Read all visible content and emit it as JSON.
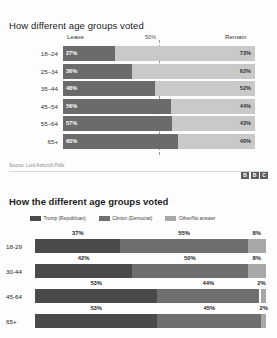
{
  "chart_data": [
    {
      "type": "bar",
      "subtype": "stacked-horizontal-100",
      "title": "How different age groups voted",
      "categories": [
        "18–24",
        "25–34",
        "35–44",
        "45–54",
        "55–64",
        "65+"
      ],
      "series": [
        {
          "name": "Leave",
          "values": [
            27,
            36,
            48,
            56,
            57,
            60
          ],
          "color": "#6b6b6b"
        },
        {
          "name": "Remain",
          "values": [
            73,
            62,
            52,
            44,
            43,
            40
          ],
          "color": "#c9c9c9"
        }
      ],
      "value_labels_left": [
        "27%",
        "36%",
        "48%",
        "56%",
        "57%",
        "60%"
      ],
      "value_labels_right": [
        "73%",
        "62%",
        "52%",
        "44%",
        "43%",
        "40%"
      ],
      "header_left": "Leave",
      "header_right": "Remain",
      "midline_label": "50%",
      "grid": false,
      "legend_position": "top",
      "source": "Source: Lord Ashcroft Polls",
      "brand": [
        "B",
        "B",
        "C"
      ]
    },
    {
      "type": "bar",
      "subtype": "stacked-horizontal-100",
      "title": "How the different age groups voted",
      "categories": [
        "18-29",
        "30-44",
        "45-64",
        "65+"
      ],
      "series": [
        {
          "name": "Trump (Republican)",
          "values": [
            37,
            42,
            53,
            53
          ],
          "color": "#4a4a4a"
        },
        {
          "name": "Clinton (Democrat)",
          "values": [
            55,
            50,
            44,
            45
          ],
          "color": "#6f6f6f"
        },
        {
          "name": "Other/No answer",
          "values": [
            8,
            8,
            2,
            2
          ],
          "color": "#a8a8a8"
        }
      ],
      "labels": [
        [
          "37%",
          "55%",
          "8%"
        ],
        [
          "42%",
          "50%",
          "8%"
        ],
        [
          "53%",
          "44%",
          "2%"
        ],
        [
          "53%",
          "45%",
          "2%"
        ]
      ],
      "grid": false,
      "legend_position": "top"
    }
  ],
  "chart1": {
    "title": "How different age groups voted",
    "header": {
      "left": "Leave",
      "mid": "50%",
      "right": "Remain"
    },
    "rows": [
      {
        "label": "18–24",
        "leave": 27,
        "remain": 73,
        "leave_label": "27%",
        "remain_label": "73%"
      },
      {
        "label": "25–34",
        "leave": 36,
        "remain": 62,
        "leave_label": "36%",
        "remain_label": "62%"
      },
      {
        "label": "35–44",
        "leave": 48,
        "remain": 52,
        "leave_label": "48%",
        "remain_label": "52%"
      },
      {
        "label": "45–54",
        "leave": 56,
        "remain": 44,
        "leave_label": "56%",
        "remain_label": "44%"
      },
      {
        "label": "55–64",
        "leave": 57,
        "remain": 43,
        "leave_label": "57%",
        "remain_label": "43%"
      },
      {
        "label": "65+",
        "leave": 60,
        "remain": 40,
        "leave_label": "60%",
        "remain_label": "40%"
      }
    ],
    "source": "Source: Lord Ashcroft Polls",
    "brand": {
      "b1": "B",
      "b2": "B",
      "b3": "C"
    }
  },
  "chart2": {
    "title": "How the different age groups voted",
    "legend": [
      {
        "label": "Trump (Republican)",
        "color": "#4a4a4a"
      },
      {
        "label": "Clinton (Democrat)",
        "color": "#6f6f6f"
      },
      {
        "label": "Other/No answer",
        "color": "#a8a8a8"
      }
    ],
    "rows": [
      {
        "label": "18-29",
        "trump": 37,
        "clinton": 55,
        "other": 8,
        "trump_label": "37%",
        "clinton_label": "55%",
        "other_label": "8%"
      },
      {
        "label": "30-44",
        "trump": 42,
        "clinton": 50,
        "other": 8,
        "trump_label": "42%",
        "clinton_label": "50%",
        "other_label": "8%"
      },
      {
        "label": "45-64",
        "trump": 53,
        "clinton": 44,
        "other": 2,
        "trump_label": "53%",
        "clinton_label": "44%",
        "other_label": "2%"
      },
      {
        "label": "65+",
        "trump": 53,
        "clinton": 45,
        "other": 2,
        "trump_label": "53%",
        "clinton_label": "45%",
        "other_label": "2%"
      }
    ]
  }
}
